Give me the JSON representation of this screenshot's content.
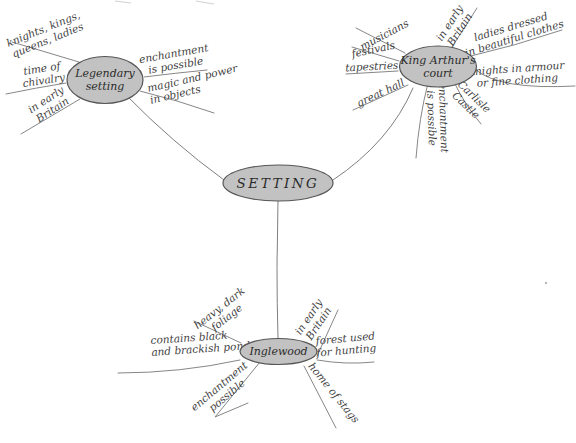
{
  "colors": {
    "node_fill": "#c2c2c2",
    "node_stroke": "#565656",
    "line": "#7f7f7f",
    "label_text": "#3f3f3f",
    "node_text": "#2b2b2b",
    "background": "#ffffff"
  },
  "center": {
    "label": "SETTING"
  },
  "branches": [
    {
      "name": "Legendary setting",
      "node_lines": [
        "Legendary",
        "setting"
      ],
      "children": [
        {
          "lines": [
            "knights, kings,",
            "queens, ladies"
          ]
        },
        {
          "lines": [
            "time of",
            "chivalry"
          ]
        },
        {
          "lines": [
            "in early",
            "Britain"
          ]
        },
        {
          "lines": [
            "enchantment",
            "is possible"
          ]
        },
        {
          "lines": [
            "magic and power",
            "in objects"
          ]
        }
      ]
    },
    {
      "name": "King Arthur's court",
      "node_lines": [
        "King Arthur's",
        "court"
      ],
      "children": [
        {
          "lines": [
            "musicians"
          ]
        },
        {
          "lines": [
            "festivals"
          ]
        },
        {
          "lines": [
            "tapestries"
          ]
        },
        {
          "lines": [
            "great hall"
          ]
        },
        {
          "lines": [
            "in early",
            "Britain"
          ]
        },
        {
          "lines": [
            "ladies dressed",
            "in beautiful clothes"
          ]
        },
        {
          "lines": [
            "knights in armour",
            "or fine clothing"
          ]
        },
        {
          "lines": [
            "Carlisle",
            "Castle"
          ]
        },
        {
          "lines": [
            "enchantment",
            "is possible"
          ]
        }
      ]
    },
    {
      "name": "Inglewood",
      "node_lines": [
        "Inglewood"
      ],
      "children": [
        {
          "lines": [
            "heavy, dark",
            "foliage"
          ]
        },
        {
          "lines": [
            "contains black",
            "and brackish pond"
          ]
        },
        {
          "lines": [
            "enchantment",
            "possible"
          ]
        },
        {
          "lines": [
            "in early",
            "Britain"
          ]
        },
        {
          "lines": [
            "forest used",
            "for hunting"
          ]
        },
        {
          "lines": [
            "home of stags"
          ]
        }
      ]
    }
  ]
}
